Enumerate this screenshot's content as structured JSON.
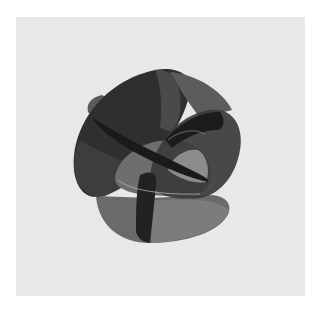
{
  "figure": {
    "background_color": "#e8e8e8",
    "border_color": "#ffffff",
    "shading_colors": {
      "darkest": "#1e1e1e",
      "dark": "#2e2e2e",
      "mid_dark": "#474747",
      "mid": "#5e5e5e",
      "light": "#787878",
      "highlight": "#a8a8a8"
    }
  }
}
